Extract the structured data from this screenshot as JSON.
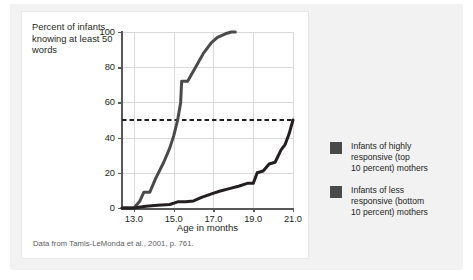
{
  "figure": {
    "y_axis_caption": "Percent of infants knowing at least 50 words",
    "x_axis_title": "Age in months",
    "source_note": "Data from Tamis-LeMonda et al., 2001, p. 761."
  },
  "legend": {
    "position": "right",
    "items": [
      {
        "label": "Infants of highly\nresponsive (top\n10 percent) mothers",
        "color": "#4a4a4a"
      },
      {
        "label": "Infants of less\nresponsive (bottom\n10 percent) mothers",
        "color": "#4a4a4a"
      }
    ]
  },
  "chart_data": {
    "type": "line",
    "title": "",
    "xlabel": "Age in months",
    "ylabel": "Percent of infants knowing at least 50 words",
    "xlim": [
      12.4,
      21.0
    ],
    "ylim": [
      0,
      100
    ],
    "xticks": [
      13.0,
      15.0,
      17.0,
      19.0,
      21.0
    ],
    "xtick_labels": [
      "13.0",
      "15.0",
      "17.0",
      "19.0",
      "21.0"
    ],
    "yticks": [
      0,
      20,
      40,
      60,
      80,
      100
    ],
    "ytick_labels": [
      "0",
      "20",
      "40",
      "60",
      "80",
      "100"
    ],
    "grid": true,
    "annotations": [
      {
        "type": "hline",
        "y": 50,
        "style": "dashed",
        "color": "#231f20",
        "label": "50 percent reference line"
      }
    ],
    "series": [
      {
        "name": "Infants of highly responsive (top 10 percent) mothers",
        "color": "#4a4a4a",
        "x": [
          12.4,
          13.0,
          13.3,
          13.5,
          13.8,
          14.1,
          14.5,
          14.8,
          15.0,
          15.2,
          15.35,
          15.4,
          15.7,
          15.85,
          16.1,
          16.5,
          16.9,
          17.2,
          17.6,
          17.9,
          18.1
        ],
        "y": [
          0,
          0,
          4,
          9,
          9,
          17,
          26,
          34,
          41,
          50,
          60,
          72,
          72,
          75,
          80,
          88,
          94,
          97,
          99,
          100,
          100
        ]
      },
      {
        "name": "Infants of less responsive (bottom 10 percent) mothers",
        "color": "#231f20",
        "x": [
          12.4,
          13.0,
          13.6,
          14.2,
          14.8,
          15.2,
          15.6,
          16.0,
          16.4,
          16.9,
          17.3,
          17.8,
          18.3,
          18.7,
          19.0,
          19.2,
          19.5,
          19.8,
          20.1,
          20.4,
          20.6,
          20.8,
          21.0
        ],
        "y": [
          0,
          0,
          1,
          1.5,
          2,
          3.5,
          3.5,
          4,
          6,
          8,
          9.5,
          11,
          12.5,
          14,
          14,
          20,
          21,
          25,
          26,
          33,
          36,
          42,
          50
        ]
      }
    ]
  }
}
